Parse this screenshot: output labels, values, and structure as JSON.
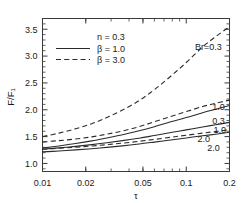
{
  "chart_data": {
    "type": "line",
    "title": "",
    "xlabel": "τ",
    "ylabel": "F/F₁",
    "xscale": "log",
    "yscale": "linear",
    "xlim": [
      0.01,
      0.2
    ],
    "ylim": [
      0.85,
      3.7
    ],
    "grid": false,
    "xticks": [
      0.01,
      0.02,
      0.05,
      0.1,
      0.2
    ],
    "xticklabels": [
      "0.01",
      "0.02",
      "0.05",
      "0.1",
      "0.2"
    ],
    "yticks": [
      1.0,
      1.5,
      2.0,
      2.5,
      3.0,
      3.5
    ],
    "yticklabels": [
      "1.0",
      "1.5",
      "2.0",
      "2.5",
      "3.0",
      "3.5"
    ],
    "legend": {
      "position": "upper-left-inner",
      "entries": [
        {
          "label": "n = 0.3",
          "style": "none"
        },
        {
          "label": "β = 1.0",
          "style": "solid"
        },
        {
          "label": "β = 3.0",
          "style": "dashed"
        }
      ]
    },
    "annotations": [
      {
        "text": "Br=0.3",
        "x": 0.115,
        "y": 3.18
      },
      {
        "text": "1.0",
        "x": 0.152,
        "y": 2.06
      },
      {
        "text": "0.3",
        "x": 0.152,
        "y": 1.8
      },
      {
        "text": "1.0",
        "x": 0.155,
        "y": 1.62
      },
      {
        "text": "2.0",
        "x": 0.12,
        "y": 1.47
      },
      {
        "text": "2.0",
        "x": 0.14,
        "y": 1.3
      }
    ],
    "series": [
      {
        "name": "Br=0.3",
        "beta": 3.0,
        "br": 0.3,
        "style": "dashed",
        "x": [
          0.01,
          0.013,
          0.017,
          0.022,
          0.028,
          0.036,
          0.047,
          0.06,
          0.078,
          0.1,
          0.13,
          0.16,
          0.2
        ],
        "y": [
          1.5,
          1.565,
          1.645,
          1.74,
          1.855,
          1.995,
          2.17,
          2.375,
          2.625,
          2.88,
          3.17,
          3.36,
          3.55
        ]
      },
      {
        "name": "1.0-dashed",
        "beta": 3.0,
        "br": 1.0,
        "style": "dashed",
        "x": [
          0.01,
          0.013,
          0.017,
          0.022,
          0.028,
          0.036,
          0.047,
          0.06,
          0.078,
          0.1,
          0.13,
          0.16,
          0.2
        ],
        "y": [
          1.4,
          1.425,
          1.455,
          1.495,
          1.545,
          1.605,
          1.685,
          1.775,
          1.875,
          1.965,
          2.06,
          2.12,
          2.18
        ]
      },
      {
        "name": "0.3-solid",
        "beta": 1.0,
        "br": 0.3,
        "style": "solid",
        "x": [
          0.01,
          0.013,
          0.017,
          0.022,
          0.028,
          0.036,
          0.047,
          0.06,
          0.078,
          0.1,
          0.13,
          0.16,
          0.2
        ],
        "y": [
          1.285,
          1.325,
          1.37,
          1.42,
          1.475,
          1.535,
          1.61,
          1.685,
          1.775,
          1.855,
          1.945,
          2.01,
          2.08
        ]
      },
      {
        "name": "1.0-solid",
        "beta": 1.0,
        "br": 1.0,
        "style": "solid",
        "x": [
          0.01,
          0.013,
          0.017,
          0.022,
          0.028,
          0.036,
          0.047,
          0.06,
          0.078,
          0.1,
          0.13,
          0.16,
          0.2
        ],
        "y": [
          1.265,
          1.29,
          1.318,
          1.35,
          1.385,
          1.425,
          1.47,
          1.52,
          1.575,
          1.625,
          1.68,
          1.72,
          1.765
        ]
      },
      {
        "name": "2.0-dashed",
        "beta": 3.0,
        "br": 2.0,
        "style": "dashed",
        "x": [
          0.01,
          0.013,
          0.017,
          0.022,
          0.028,
          0.036,
          0.047,
          0.06,
          0.078,
          0.1,
          0.13,
          0.16,
          0.2
        ],
        "y": [
          1.265,
          1.282,
          1.302,
          1.325,
          1.35,
          1.378,
          1.412,
          1.448,
          1.488,
          1.525,
          1.565,
          1.595,
          1.63
        ]
      },
      {
        "name": "2.0-solid",
        "beta": 1.0,
        "br": 2.0,
        "style": "solid",
        "x": [
          0.01,
          0.013,
          0.017,
          0.022,
          0.028,
          0.036,
          0.047,
          0.06,
          0.078,
          0.1,
          0.13,
          0.16,
          0.2
        ],
        "y": [
          1.215,
          1.232,
          1.252,
          1.275,
          1.3,
          1.328,
          1.362,
          1.398,
          1.438,
          1.475,
          1.515,
          1.545,
          1.58
        ]
      }
    ]
  },
  "axes": {
    "x_label": "τ",
    "y_label": "F/F₁"
  }
}
